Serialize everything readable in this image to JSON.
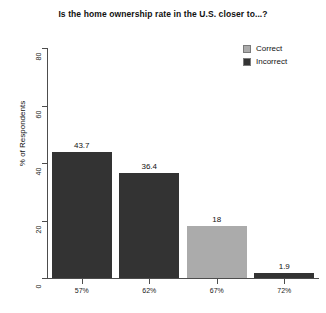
{
  "chart_data": {
    "type": "bar",
    "title": "Is the home ownership rate in the U.S. closer to...?",
    "xlabel": "",
    "ylabel": "% of Respondents",
    "categories": [
      "57%",
      "62%",
      "67%",
      "72%"
    ],
    "values": [
      43.7,
      36.4,
      18,
      1.9
    ],
    "value_labels": [
      "43.7",
      "36.4",
      "18",
      "1.9"
    ],
    "bar_groups": [
      "Incorrect",
      "Incorrect",
      "Correct",
      "Incorrect"
    ],
    "ylim": [
      0,
      80
    ],
    "yticks": [
      0,
      20,
      40,
      60,
      80
    ],
    "ytick_labels": [
      "0",
      "20",
      "40",
      "60",
      "80"
    ],
    "grid": false,
    "legend_position": "top-right",
    "series": [
      {
        "name": "Correct",
        "color": "#ababab",
        "values": [
          null,
          null,
          18,
          null
        ]
      },
      {
        "name": "Incorrect",
        "color": "#333333",
        "values": [
          43.7,
          36.4,
          null,
          1.9
        ]
      }
    ]
  },
  "legend": {
    "items": [
      {
        "label": "Correct",
        "color": "#ababab"
      },
      {
        "label": "Incorrect",
        "color": "#333333"
      }
    ]
  },
  "colors": {
    "correct": "#ababab",
    "incorrect": "#333333",
    "axis": "#4d4d4d",
    "text": "#111111",
    "background": "#ffffff"
  }
}
